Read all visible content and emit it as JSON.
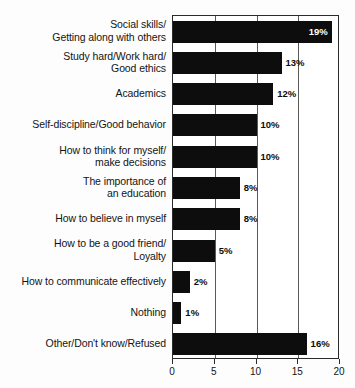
{
  "chart_data": {
    "type": "bar",
    "orientation": "horizontal",
    "title": "",
    "xlabel": "",
    "ylabel": "",
    "xlim": [
      0,
      20
    ],
    "grid": true,
    "legend": false,
    "value_suffix": "%",
    "categories": [
      "Social skills/\nGetting along with others",
      "Study hard/Work hard/\nGood ethics",
      "Academics",
      "Self-discipline/Good behavior",
      "How to think for myself/\nmake decisions",
      "The importance of\nan education",
      "How to believe in myself",
      "How to be a good friend/\nLoyalty",
      "How to communicate effectively",
      "Nothing",
      "Other/Don't know/Refused"
    ],
    "values": [
      19,
      13,
      12,
      10,
      10,
      8,
      8,
      5,
      2,
      1,
      16
    ],
    "value_labels": [
      "19%",
      "13%",
      "12%",
      "10%",
      "10%",
      "8%",
      "8%",
      "5%",
      "2%",
      "1%",
      "16%"
    ],
    "label_placement": [
      "inside",
      "outside",
      "outside",
      "outside",
      "outside",
      "outside",
      "outside",
      "outside",
      "outside",
      "outside",
      "outside"
    ],
    "xticks": [
      0,
      5,
      10,
      15,
      20
    ],
    "xtick_labels": [
      "0",
      "5",
      "10",
      "15",
      "20"
    ],
    "bar_color": "#0d0d0d",
    "plot_background": "#ffffff",
    "axis_color": "#2b2b2b"
  }
}
